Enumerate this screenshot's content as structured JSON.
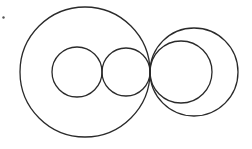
{
  "diagram": {
    "type": "tangent-circles",
    "stroke_color": "#2a2a2a",
    "background": "#ffffff",
    "stroke_width": 1.3,
    "marker": {
      "cx": 3.5,
      "cy": 17.5,
      "r": 1.2,
      "color": "#555555"
    },
    "circles": [
      {
        "id": "large-left",
        "cx": 85,
        "cy": 72,
        "r": 65
      },
      {
        "id": "small-left-1",
        "cx": 77,
        "cy": 72,
        "r": 25
      },
      {
        "id": "small-left-2",
        "cx": 126,
        "cy": 72,
        "r": 24
      },
      {
        "id": "large-right",
        "cx": 194,
        "cy": 72,
        "r": 44
      },
      {
        "id": "medium-right",
        "cx": 181,
        "cy": 72,
        "r": 31
      }
    ],
    "tangent_point": {
      "x": 150,
      "y": 72
    }
  }
}
